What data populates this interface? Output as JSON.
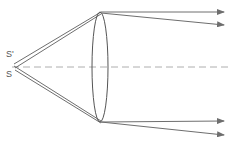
{
  "diagram": {
    "type": "optics-lens-ray-diagram",
    "labels": {
      "source_upper": "S'",
      "source_lower": "S"
    },
    "colors": {
      "ray": "#6e6e6e",
      "lens": "#555555",
      "axis": "#9a9a9a",
      "text": "#555555"
    },
    "elements": [
      "point-source S",
      "point-source S'",
      "convex-lens",
      "optical-axis (dashed)",
      "4 refracted rays with arrows"
    ]
  }
}
